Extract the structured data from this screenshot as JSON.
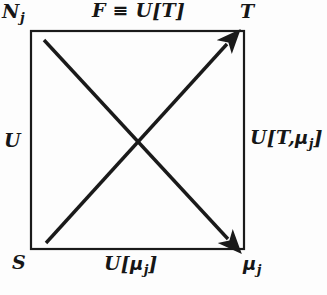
{
  "diagram": {
    "box": {
      "x": 31,
      "y": 31,
      "width": 213,
      "height": 218,
      "stroke_color": "#1a1a1a",
      "stroke_width": 2.2
    },
    "arrows": [
      {
        "name": "ascending-diagonal-arrow",
        "from": [
          46,
          243
        ],
        "to": [
          230,
          40
        ],
        "direction": "up-right",
        "arrowhead": "end",
        "stroke_color": "#1a1a1a",
        "stroke_width": 3.4
      },
      {
        "name": "descending-diagonal-arrow",
        "from": [
          44,
          40
        ],
        "to": [
          231,
          242
        ],
        "direction": "down-right",
        "arrowhead": "end",
        "stroke_color": "#1a1a1a",
        "stroke_width": 3.4
      }
    ],
    "labels": {
      "top_left": {
        "base": "N",
        "subscript": "j"
      },
      "top_middle": {
        "text": "F ≡ U[T]"
      },
      "top_right": {
        "text": "T"
      },
      "left": {
        "text": "U"
      },
      "right": {
        "base_open": "U[T,",
        "greek": "μ",
        "subscript": "j",
        "close": "]"
      },
      "bottom_left": {
        "text": "S"
      },
      "bottom_middle": {
        "base_open": "U[",
        "greek": "μ",
        "subscript": "j",
        "close": "]"
      },
      "bottom_right": {
        "greek": "μ",
        "subscript": "j"
      }
    },
    "colors": {
      "background": "#fdfdfd",
      "ink": "#161616"
    }
  }
}
